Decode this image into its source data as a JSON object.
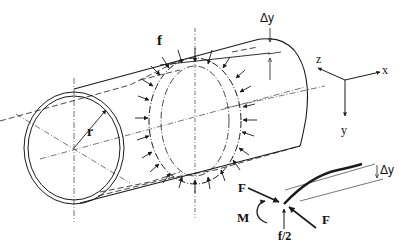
{
  "figure": {
    "type": "engineering-diagram",
    "colors": {
      "ink": "#1a1a1a",
      "background": "#ffffff"
    }
  },
  "labels": {
    "ring_load": "f",
    "radius": "r",
    "deflection_top": "Δy",
    "axis_x": "x",
    "axis_y": "y",
    "axis_z": "z",
    "force_upper": "F",
    "force_lower": "F",
    "moment": "M",
    "half_load": "f/2",
    "deflection_detail": "Δy"
  }
}
